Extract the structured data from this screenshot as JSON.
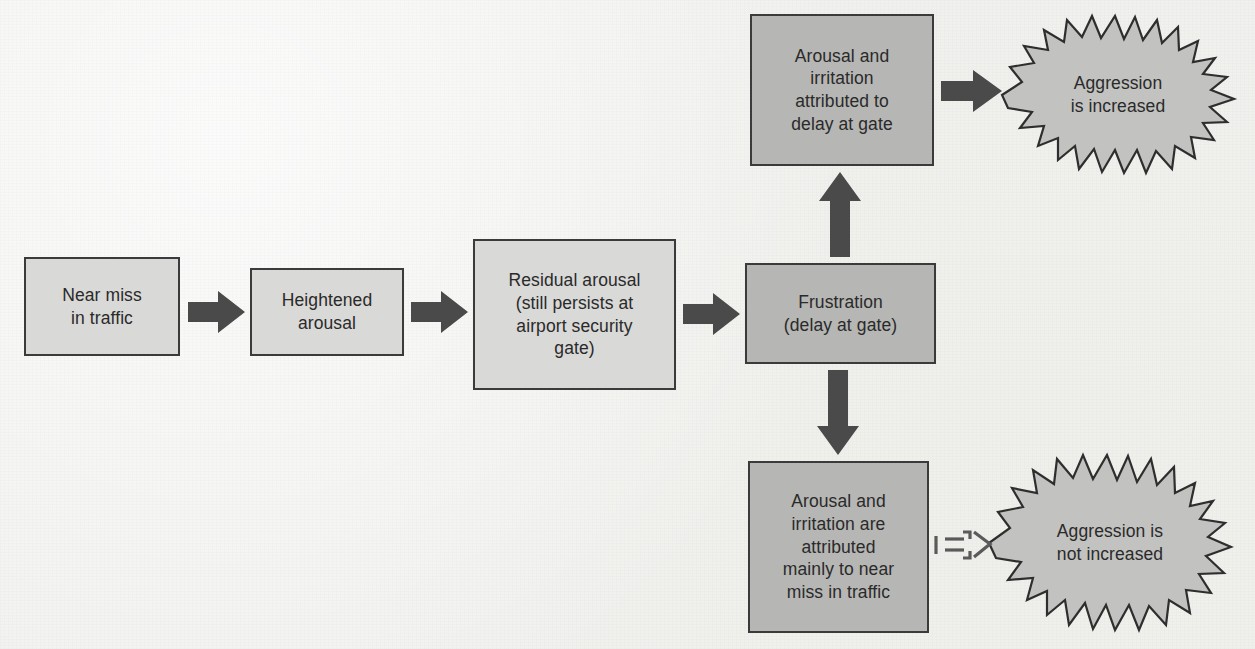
{
  "diagram": {
    "colors": {
      "background": "#f1f1ef",
      "box_light_fill": "#d9d9d7",
      "box_dark_fill": "#b6b6b4",
      "box_stroke": "#3b3b3b",
      "arrow_fill": "#4a4a4a",
      "burst_fill": "#c2c2c0",
      "burst_stroke": "#2e2e2e",
      "text": "#2a2a2a"
    },
    "nodes": [
      {
        "id": "near-miss",
        "label": "Near miss\nin traffic",
        "shape": "box",
        "tone": "light"
      },
      {
        "id": "heightened-arousal",
        "label": "Heightened\narousal",
        "shape": "box",
        "tone": "light"
      },
      {
        "id": "residual-arousal",
        "label": "Residual arousal\n(still persists at\nairport security\ngate)",
        "shape": "box",
        "tone": "light"
      },
      {
        "id": "frustration",
        "label": "Frustration\n(delay at gate)",
        "shape": "box",
        "tone": "dark"
      },
      {
        "id": "attributed-to-delay",
        "label": "Arousal and\nirritation\nattributed to\ndelay at gate",
        "shape": "box",
        "tone": "dark"
      },
      {
        "id": "attributed-to-near-miss",
        "label": "Arousal and\nirritation are\nattributed\nmainly to near\nmiss in traffic",
        "shape": "box",
        "tone": "dark"
      },
      {
        "id": "aggression-increased",
        "label": "Aggression\nis increased",
        "shape": "starburst",
        "tone": "burst"
      },
      {
        "id": "aggression-not-increased",
        "label": "Aggression is\nnot increased",
        "shape": "starburst",
        "tone": "burst"
      }
    ],
    "edges": [
      {
        "id": "e1",
        "from": "near-miss",
        "to": "heightened-arousal",
        "direction": "right",
        "style": "solid"
      },
      {
        "id": "e2",
        "from": "heightened-arousal",
        "to": "residual-arousal",
        "direction": "right",
        "style": "solid"
      },
      {
        "id": "e3",
        "from": "residual-arousal",
        "to": "frustration",
        "direction": "right",
        "style": "solid"
      },
      {
        "id": "e4",
        "from": "frustration",
        "to": "attributed-to-delay",
        "direction": "up",
        "style": "solid"
      },
      {
        "id": "e5",
        "from": "frustration",
        "to": "attributed-to-near-miss",
        "direction": "down",
        "style": "solid"
      },
      {
        "id": "e6",
        "from": "attributed-to-delay",
        "to": "aggression-increased",
        "direction": "right",
        "style": "solid"
      },
      {
        "id": "e7",
        "from": "attributed-to-near-miss",
        "to": "aggression-not-increased",
        "direction": "right",
        "style": "dashed-outline"
      }
    ]
  }
}
